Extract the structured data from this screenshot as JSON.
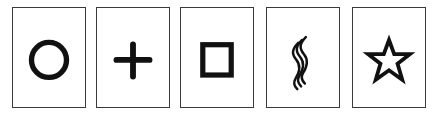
{
  "colors": {
    "ink": "#111111",
    "border": "#3a3a3a",
    "background": "#ffffff"
  },
  "cards": [
    {
      "symbol": "circle",
      "icon": "circle-icon",
      "left": 12
    },
    {
      "symbol": "plus",
      "icon": "plus-icon",
      "left": 96
    },
    {
      "symbol": "square",
      "icon": "square-icon",
      "left": 180
    },
    {
      "symbol": "waves",
      "icon": "wavy-lines-icon",
      "left": 266
    },
    {
      "symbol": "star",
      "icon": "star-icon",
      "left": 352
    }
  ]
}
